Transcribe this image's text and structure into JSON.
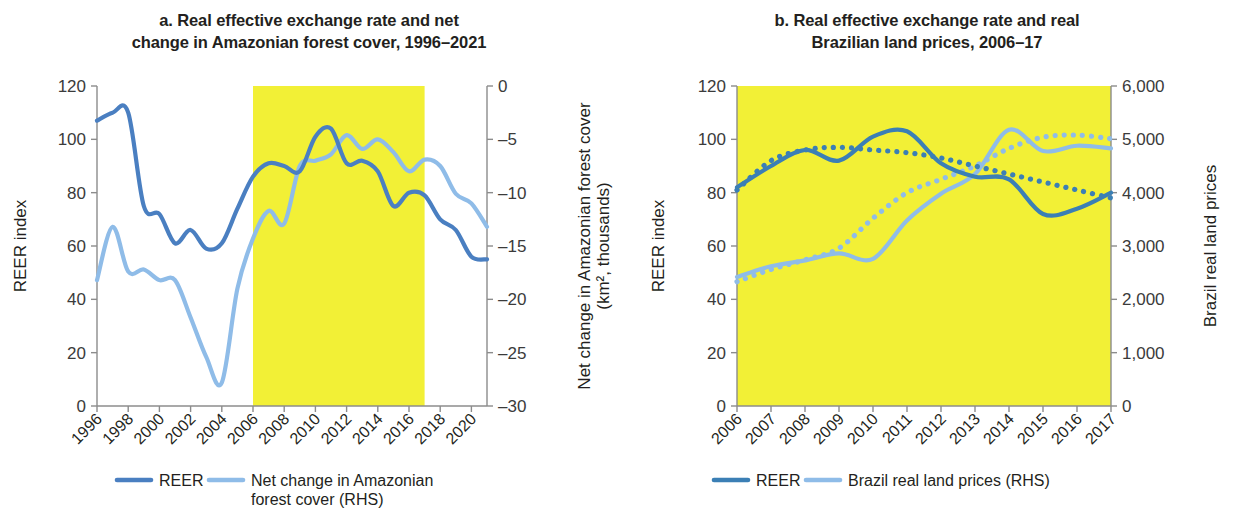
{
  "figure": {
    "panels": [
      "a",
      "b"
    ]
  },
  "panel_a": {
    "title_line1": "a. Real effective exchange rate and net",
    "title_line2": "change in Amazonian forest cover, 1996–2021",
    "left_axis_title": "REER index",
    "right_axis_title_line1": "Net change in Amazonian forest cover",
    "right_axis_title_line2": "(km², thousands)",
    "legend": [
      {
        "label": "REER",
        "color": "#4a7fc1",
        "style": "solid"
      },
      {
        "label": "Net change in Amazonian",
        "label2": "forest cover (RHS)",
        "color": "#8fbce8",
        "style": "solid"
      }
    ],
    "shaded_region": {
      "start": 2006,
      "end": 2017,
      "color": "#f2f036"
    }
  },
  "panel_b": {
    "title_line1": "b. Real effective exchange rate and real",
    "title_line2": "Brazilian land prices, 2006–17",
    "left_axis_title": "REER index",
    "right_axis_title": "Brazil real land prices",
    "legend": [
      {
        "label": "REER",
        "color": "#3b7fb5",
        "style": "solid"
      },
      {
        "label": "Brazil real land prices (RHS)",
        "color": "#8fbce8",
        "style": "solid"
      }
    ],
    "shaded_region": {
      "start": 2006,
      "end": 2017,
      "color": "#f2f036"
    }
  },
  "chart_data": [
    {
      "type": "line",
      "panel": "a",
      "title": "a. Real effective exchange rate and net change in Amazonian forest cover, 1996–2021",
      "xlabel": "",
      "ylabel": "REER index",
      "y2label": "Net change in Amazonian forest cover (km², thousands)",
      "xlim": [
        1996,
        2021
      ],
      "ylim": [
        0,
        120
      ],
      "y2lim": [
        -30,
        0
      ],
      "yticks": [
        0,
        20,
        40,
        60,
        80,
        100,
        120
      ],
      "y2ticks": [
        -30,
        -25,
        -20,
        -15,
        -10,
        -5,
        0
      ],
      "xticks": [
        1996,
        1998,
        2000,
        2002,
        2004,
        2006,
        2008,
        2010,
        2012,
        2014,
        2016,
        2018,
        2020
      ],
      "xtick_labels": [
        "1996",
        "1998",
        "2000",
        "2002",
        "2004",
        "2006",
        "2008",
        "2010",
        "2012",
        "2014",
        "2016",
        "2018",
        "2020"
      ],
      "grid": false,
      "legend_position": "bottom",
      "highlight_band": {
        "from": 2006,
        "to": 2017
      },
      "x": [
        1996,
        1997,
        1998,
        1999,
        2000,
        2001,
        2002,
        2003,
        2004,
        2005,
        2006,
        2007,
        2008,
        2009,
        2010,
        2011,
        2012,
        2013,
        2014,
        2015,
        2016,
        2017,
        2018,
        2019,
        2020,
        2021
      ],
      "series": [
        {
          "name": "REER",
          "axis": "left",
          "color": "#4a7fc1",
          "style": "solid",
          "values": [
            107,
            110,
            110,
            75,
            72,
            61,
            66,
            59,
            61,
            74,
            86,
            91,
            90,
            88,
            101,
            104,
            91,
            92,
            88,
            75,
            80,
            79,
            70,
            66,
            56,
            55
          ]
        },
        {
          "name": "Net change in Amazonian forest cover (RHS)",
          "axis": "right",
          "color": "#8fbce8",
          "values": [
            -18.2,
            -13.2,
            -17.4,
            -17.2,
            -18.2,
            -18.2,
            -21.7,
            -25.4,
            -27.8,
            -19.0,
            -14.3,
            -11.7,
            -12.9,
            -7.5,
            -7.0,
            -6.4,
            -4.6,
            -5.9,
            -5.0,
            -6.2,
            -8.0,
            -6.9,
            -7.5,
            -10.1,
            -11.0,
            -13.2
          ]
        }
      ]
    },
    {
      "type": "line",
      "panel": "b",
      "title": "b. Real effective exchange rate and real Brazilian land prices, 2006–17",
      "xlabel": "",
      "ylabel": "REER index",
      "y2label": "Brazil real land prices",
      "xlim": [
        2006,
        2017
      ],
      "ylim": [
        0,
        120
      ],
      "y2lim": [
        0,
        6000
      ],
      "yticks": [
        0,
        20,
        40,
        60,
        80,
        100,
        120
      ],
      "y2ticks": [
        0,
        1000,
        2000,
        3000,
        4000,
        5000,
        6000
      ],
      "y2tick_labels": [
        "0",
        "1,000",
        "2,000",
        "3,000",
        "4,000",
        "5,000",
        "6,000"
      ],
      "xticks": [
        2006,
        2007,
        2008,
        2009,
        2010,
        2011,
        2012,
        2013,
        2014,
        2015,
        2016,
        2017
      ],
      "xtick_labels": [
        "2006",
        "2007",
        "2008",
        "2009",
        "2010",
        "2011",
        "2012",
        "2013",
        "2014",
        "2015",
        "2016",
        "2017"
      ],
      "grid": false,
      "legend_position": "bottom",
      "highlight_band": {
        "from": 2006,
        "to": 2017
      },
      "x": [
        2006,
        2007,
        2008,
        2009,
        2010,
        2011,
        2012,
        2013,
        2014,
        2015,
        2016,
        2017
      ],
      "series": [
        {
          "name": "REER",
          "axis": "left",
          "color": "#3b7fb5",
          "style": "solid",
          "values": [
            82,
            90,
            96,
            92,
            101,
            103,
            91,
            86,
            85,
            72,
            74,
            80
          ]
        },
        {
          "name": "REER trend",
          "axis": "left",
          "color": "#3b7fb5",
          "style": "dotted",
          "values": [
            81,
            92,
            96,
            97,
            96,
            95,
            93,
            90,
            87,
            84,
            81,
            78
          ]
        },
        {
          "name": "Brazil real land prices (RHS)",
          "axis": "right",
          "color": "#8fbce8",
          "style": "solid",
          "values": [
            2420,
            2620,
            2730,
            2860,
            2760,
            3480,
            3980,
            4350,
            5180,
            4780,
            4880,
            4830
          ]
        },
        {
          "name": "Brazil real land prices trend",
          "axis": "right",
          "color": "#8fbce8",
          "style": "dotted",
          "values": [
            2330,
            2560,
            2740,
            2960,
            3520,
            4000,
            4250,
            4500,
            4830,
            5040,
            5080,
            5010
          ]
        }
      ]
    }
  ]
}
